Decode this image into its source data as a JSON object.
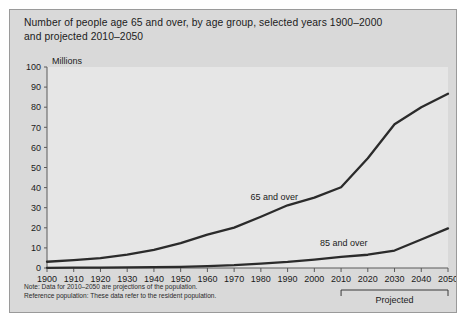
{
  "figure": {
    "title_line1": "Number of people age 65 and over, by age group, selected years 1900–2000",
    "title_line2": "and projected 2010–2050",
    "note_line1": "Note: Data for 2010–2050 are projections of the population.",
    "note_line2": "Reference population: These data refer to the resident population.",
    "panel_bg": "#d9d9d9",
    "plot_bg": "#e6e6e6",
    "border_color": "#9a9a9a",
    "line_color": "#2b2b2b"
  },
  "chart_data": {
    "type": "line",
    "title": "Number of people age 65 and over, by age group, selected years 1900–2000 and projected 2010–2050",
    "xlabel": "",
    "ylabel": "Millions",
    "ylim": [
      0,
      100
    ],
    "xlim": [
      1900,
      2050
    ],
    "ytick_step": 10,
    "grid": false,
    "legend_position": "inline-annotation",
    "yticks": [
      0,
      10,
      20,
      30,
      40,
      50,
      60,
      70,
      80,
      90,
      100
    ],
    "categories": [
      1900,
      1910,
      1920,
      1930,
      1940,
      1950,
      1960,
      1970,
      1980,
      1990,
      2000,
      2010,
      2020,
      2030,
      2040,
      2050
    ],
    "xtick_labels": [
      "1900",
      "1910",
      "1920",
      "1930",
      "1940",
      "1950",
      "1960",
      "1970",
      "1980",
      "1990",
      "2000",
      "2010",
      "2020",
      "2030",
      "2040",
      "2050"
    ],
    "series": [
      {
        "name": "65 and over",
        "label": "65 and over",
        "label_x": 1985,
        "label_y": 34,
        "values": [
          3.1,
          3.9,
          4.9,
          6.7,
          9.0,
          12.4,
          16.6,
          20.1,
          25.5,
          31.2,
          35.0,
          40.2,
          54.6,
          71.5,
          80.0,
          86.7
        ]
      },
      {
        "name": "85 and over",
        "label": "85 and over",
        "label_x": 2011,
        "label_y": 11,
        "values": [
          0.1,
          0.2,
          0.2,
          0.3,
          0.4,
          0.6,
          0.9,
          1.4,
          2.2,
          3.0,
          4.2,
          5.5,
          6.6,
          8.7,
          14.2,
          19.7
        ]
      }
    ],
    "annotations": [
      {
        "name": "projected-bracket",
        "text": "Projected",
        "x_start": 2010,
        "x_end": 2050
      }
    ]
  }
}
